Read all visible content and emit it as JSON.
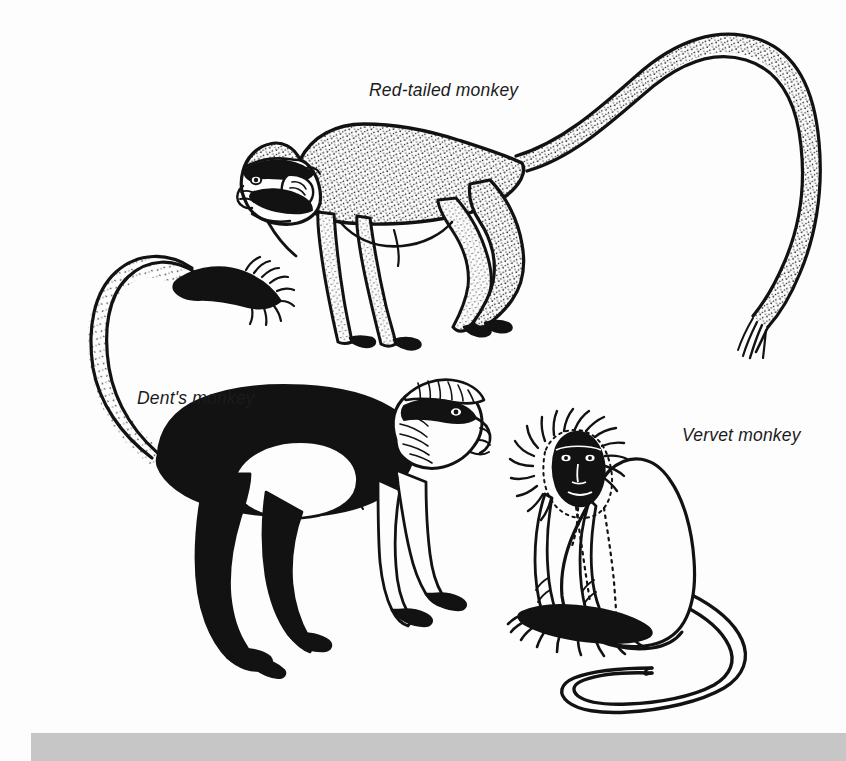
{
  "page": {
    "kind": "field-guide illustration plate",
    "background_color": "#fdfdfd",
    "ink_color": "#121212",
    "footer_bar_color": "#c6c6c6",
    "width": 846,
    "height": 761
  },
  "figures": [
    {
      "id": "red-tailed-monkey",
      "label": "Red-tailed monkey",
      "pose": "standing in profile, facing left, long tail arcing up and over to the right",
      "shading": "stippled body and limbs, black brow band and cheek whiskers, white cheek patches, pale muzzle",
      "label_position": {
        "x": 369,
        "y": 80
      }
    },
    {
      "id": "dents-monkey",
      "label": "Dent's monkey",
      "pose": "walking in profile, facing right, tail sweeping up and back to the left",
      "shading": "solid black body and limbs, white belly and chest patch, white face with pale brow crest, stippled tail with black bushy tip",
      "label_position": {
        "x": 137,
        "y": 388
      }
    },
    {
      "id": "vervet-monkey",
      "label": "Vervet monkey",
      "pose": "seated facing forward, long tail curving down and looping to the left",
      "shading": "plain white body outline, black face framed by a pale radiating fur ruff, black hands and feet",
      "label_position": {
        "x": 682,
        "y": 425
      }
    }
  ],
  "footer": {
    "bar_label": "",
    "visible": true
  }
}
